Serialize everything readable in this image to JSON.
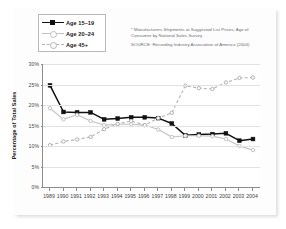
{
  "legend": {
    "items": [
      {
        "label": "Age 15–19",
        "style": "solid-black-square",
        "color": "#111111"
      },
      {
        "label": "Age 20–24",
        "style": "solid-gray-circle",
        "color": "#c2c2c2"
      },
      {
        "label": "Age 45+",
        "style": "dashed-gray-circle",
        "color": "#b3b3b3"
      }
    ]
  },
  "notes": {
    "footnote_line1": "* Manufacturers Shipments at Suggested List Prices; Age of",
    "footnote_line2": "Consumer by National Sales Survey",
    "source": "SOURCE: Recording Industry Association of America  (2004)"
  },
  "axis": {
    "y_title": "Percentage of Total Sales",
    "y_ticks": [
      "30%",
      "25%",
      "20%",
      "15%",
      "10%",
      "5%",
      "0%"
    ]
  },
  "chart_data": {
    "type": "line",
    "title": "",
    "xlabel": "",
    "ylabel": "Percentage of Total Sales",
    "ylim": [
      0,
      30
    ],
    "ytick_values": [
      0,
      5,
      10,
      15,
      20,
      25,
      30
    ],
    "grid": true,
    "legend_position": "top-left",
    "x": [
      "1989",
      "1990",
      "1991",
      "1992",
      "1993",
      "1994",
      "1995",
      "1996",
      "1997",
      "1998",
      "1999",
      "2000",
      "2001",
      "2002",
      "2003",
      "2004"
    ],
    "series": [
      {
        "name": "Age 15–19",
        "color": "#111111",
        "marker": "filled-square",
        "dash": "solid",
        "values": [
          24.8,
          18.3,
          18.2,
          18.2,
          16.5,
          16.7,
          17.0,
          17.0,
          16.8,
          15.5,
          12.6,
          12.8,
          12.9,
          13.1,
          11.3,
          11.7
        ]
      },
      {
        "name": "Age 20–24",
        "color": "#c2c2c2",
        "marker": "open-circle",
        "dash": "solid",
        "values": [
          19.2,
          16.5,
          17.6,
          16.1,
          15.1,
          15.3,
          15.3,
          15.1,
          14.0,
          12.2,
          12.5,
          12.5,
          12.4,
          11.7,
          10.0,
          9.0
        ]
      },
      {
        "name": "Age 45+",
        "color": "#b3b3b3",
        "marker": "open-circle",
        "dash": "dashed",
        "values": [
          10.2,
          11.1,
          11.6,
          12.2,
          14.1,
          15.4,
          16.1,
          15.1,
          16.8,
          18.1,
          24.7,
          24.1,
          23.9,
          25.5,
          26.6,
          26.7
        ]
      }
    ]
  }
}
